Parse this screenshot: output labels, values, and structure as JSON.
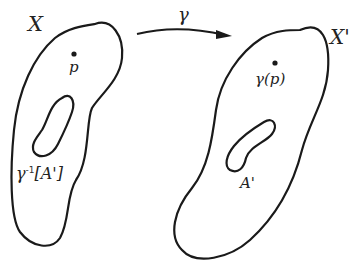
{
  "diagram": {
    "left_set": {
      "label": "X",
      "point_label": "p",
      "subset_label_base": "γ",
      "subset_label_sup": "-1",
      "subset_label_arg": "[A']"
    },
    "right_set": {
      "label": "X'",
      "point_label": "γ(p)",
      "subset_label": "A'"
    },
    "map": {
      "label": "γ"
    },
    "colors": {
      "stroke": "#1a1a1a",
      "background": "#ffffff"
    }
  }
}
